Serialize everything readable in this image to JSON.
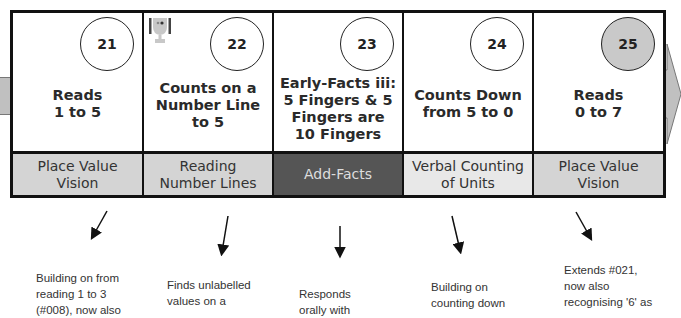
{
  "diagram": {
    "cards": [
      {
        "number": "21",
        "title_lines": [
          "Reads",
          "1 to 5"
        ],
        "category": "Place Value Vision",
        "category_lines": [
          "Place Value",
          "Vision"
        ],
        "category_style": "grey",
        "circle_filled": false,
        "has_trophy": false
      },
      {
        "number": "22",
        "title_lines": [
          "Counts on a",
          "Number Line",
          "to 5"
        ],
        "category": "Reading Number Lines",
        "category_lines": [
          "Reading",
          "Number Lines"
        ],
        "category_style": "grey",
        "circle_filled": false,
        "has_trophy": true
      },
      {
        "number": "23",
        "title_lines": [
          "Early-Facts iii:",
          "5 Fingers & 5",
          "Fingers are",
          "10 Fingers"
        ],
        "category": "Add-Facts",
        "category_lines": [
          "Add-Facts"
        ],
        "category_style": "dark",
        "circle_filled": false,
        "has_trophy": false
      },
      {
        "number": "24",
        "title_lines": [
          "Counts Down",
          "from 5 to 0"
        ],
        "category": "Verbal Counting of Units",
        "category_lines": [
          "Verbal Counting",
          "of Units"
        ],
        "category_style": "light",
        "circle_filled": false,
        "has_trophy": false
      },
      {
        "number": "25",
        "title_lines": [
          "Reads",
          "0 to 7"
        ],
        "category": "Place Value Vision",
        "category_lines": [
          "Place Value",
          "Vision"
        ],
        "category_style": "grey",
        "circle_filled": true,
        "has_trophy": false
      }
    ],
    "notes": [
      {
        "lines": [
          "Building on from",
          "reading 1 to 3",
          "(#008), now also"
        ]
      },
      {
        "lines": [
          "Finds unlabelled",
          "values on a"
        ]
      },
      {
        "lines": [
          "Responds",
          "orally with"
        ]
      },
      {
        "lines": [
          "Building on",
          "counting down"
        ]
      },
      {
        "lines": [
          "Extends #021,",
          "now also",
          "recognising '6' as"
        ]
      }
    ],
    "colors": {
      "border": "#111111",
      "category_grey": "#d4d4d4",
      "category_light": "#e8e8e8",
      "category_dark": "#555555",
      "circle_filled": "#c9c9c9",
      "flow_arrow": "#c0c0c0"
    }
  }
}
